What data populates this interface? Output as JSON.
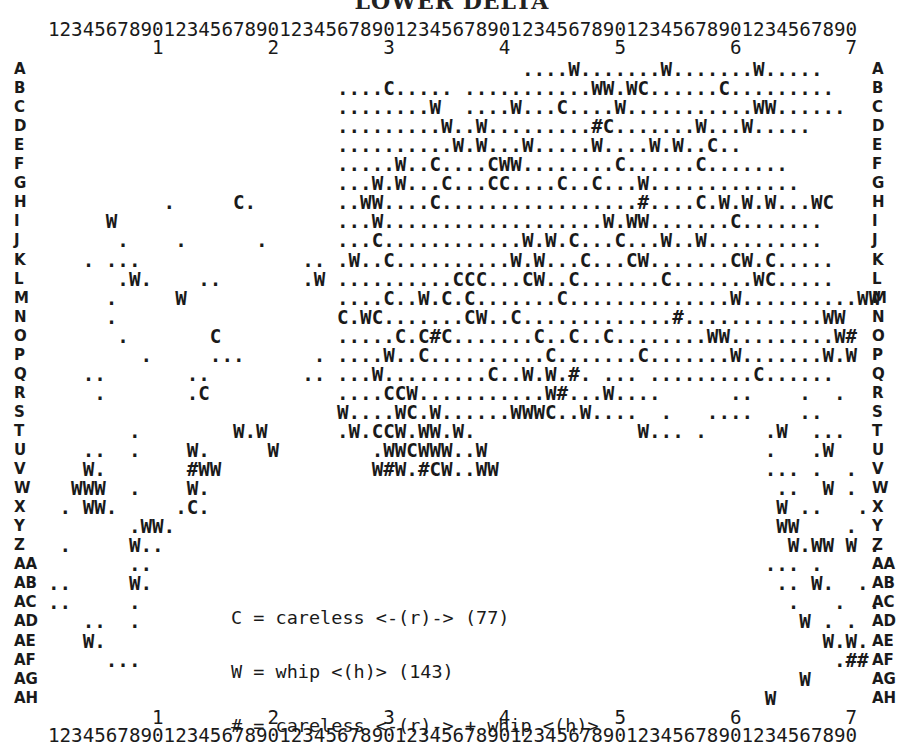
{
  "title": "LOWER DELTA",
  "ruler": {
    "units": "1234567890123456789012345678901234567890123456789012345678901234567890",
    "tens": "         1         2         3         4         5         6         7"
  },
  "rows": [
    {
      "label": "A",
      "cells": "                                         ....W.......W.......W....."
    },
    {
      "label": "B",
      "cells": "                         ....C..... ...........WW.WC......C........."
    },
    {
      "label": "C",
      "cells": "                         ........W  ....W...C....W...........WW......"
    },
    {
      "label": "D",
      "cells": "                         .........W..W.........#C.......W...W....."
    },
    {
      "label": "E",
      "cells": "                         ..........W.W...W.....W....W.W..C.."
    },
    {
      "label": "F",
      "cells": "                         .....W..C....CWW........C......C......."
    },
    {
      "label": "G",
      "cells": "                         ...W.W...C...CC....C..C...W............."
    },
    {
      "label": "H",
      "cells": "          .     C.       ..WW....C.................#....C.W.W.W...WC"
    },
    {
      "label": "I",
      "cells": "     W                   ...W...................W.WW.......C......."
    },
    {
      "label": "J",
      "cells": "      .    .      .      ...C............W.W.C...C...W..W.........."
    },
    {
      "label": "K",
      "cells": "   . ...              .. .W..C..........W.W...C...CW.......CW.C....."
    },
    {
      "label": "L",
      "cells": "      .W.    ..       .W ..........CCC...CW..C.......C.......WC....."
    },
    {
      "label": "M",
      "cells": "     .     W             ....C..W.C.C.......C..............W..........WW"
    },
    {
      "label": "N",
      "cells": "     .                   C.WC.......CW..C.............#............WW"
    },
    {
      "label": "O",
      "cells": "      .       C          .....C.C#C.......C..C..C........WW.........W#"
    },
    {
      "label": "P",
      "cells": "        .     ...      . ....W..C..........C.......C.......W.......W.W"
    },
    {
      "label": "Q",
      "cells": "   ..       ..        .. ...W.........C..W.W.#. ... .........C......"
    },
    {
      "label": "R",
      "cells": "    .       .C           ....CCW...........W#...W....      ..    .  ."
    },
    {
      "label": "S",
      "cells": "                         W....WC.W......WWWC..W....  .   ....    .."
    },
    {
      "label": "T",
      "cells": "       .        W.W      .W.CCW.WW.W.              W... .     .W  ..."
    },
    {
      "label": "U",
      "cells": "   ..  .    W.     W        .WWCWWW..W                        .   .W"
    },
    {
      "label": "V",
      "cells": "   W.       #WW             W#W.#CW..WW                       ... .  ."
    },
    {
      "label": "W",
      "cells": "  WWW  .    W.                                                 ..  W ."
    },
    {
      "label": "X",
      "cells": " . WW.     .C.                                                 W ..   ."
    },
    {
      "label": "Y",
      "cells": "       .WW.                                                    WW    ."
    },
    {
      "label": "Z",
      "cells": " .     W..                                                      W.WW W ."
    },
    {
      "label": "AA",
      "cells": "       ..                                                     ... ."
    },
    {
      "label": "AB",
      "cells": "..     W.                                                      .. W.  ."
    },
    {
      "label": "AC",
      "cells": "..     .                                                        .   .  ."
    },
    {
      "label": "AD",
      "cells": "   ..  .                                                         W . ."
    },
    {
      "label": "AE",
      "cells": "   W.                                                              W.W."
    },
    {
      "label": "AF",
      "cells": "     ...                                                            .##"
    },
    {
      "label": "AG",
      "cells": "                                                                 W"
    },
    {
      "label": "AH",
      "cells": "                                                              W"
    }
  ],
  "legend": [
    {
      "symbol": "C",
      "text": "C = careless <-(r)-> (77)"
    },
    {
      "symbol": "W",
      "text": "W = whip <(h)> (143)"
    },
    {
      "symbol": "#",
      "text": "# = careless <-(r)-> + whip <(h)>"
    }
  ],
  "counts": {
    "careless": 77,
    "whip": 143
  }
}
